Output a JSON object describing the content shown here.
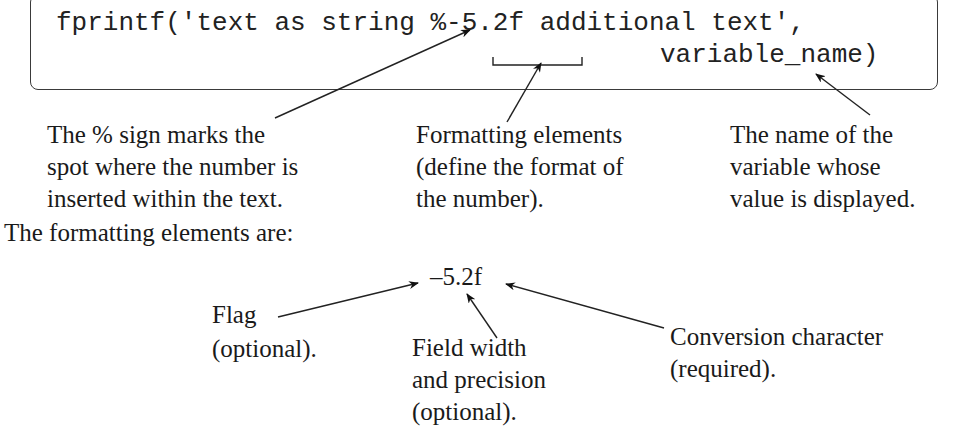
{
  "code": {
    "line1": "fprintf('text as string %-5.2f additional text',",
    "line2": "variable_name)"
  },
  "annotations": {
    "percent_sign": [
      "The % sign marks the",
      "spot where the number is",
      "inserted within the text."
    ],
    "formatting_elements": [
      "Formatting elements",
      "(define the format of",
      "the number)."
    ],
    "variable_name": [
      "The name of the",
      "variable whose",
      "value is displayed."
    ]
  },
  "subheading": "The formatting elements are:",
  "format_spec": "–5.2f",
  "parts": {
    "flag": [
      "Flag",
      "(optional)."
    ],
    "field_width": [
      "Field width",
      "and precision",
      "(optional)."
    ],
    "conversion": [
      "Conversion character",
      "(required)."
    ]
  }
}
